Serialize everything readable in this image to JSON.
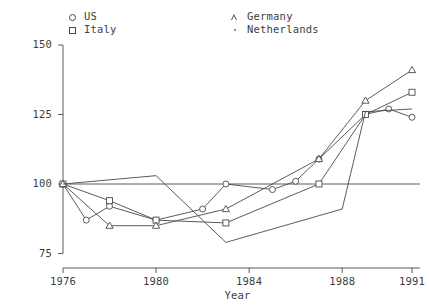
{
  "chart_data": {
    "type": "line",
    "title": "",
    "subtitle": "",
    "xlabel": "Year",
    "ylabel": "",
    "xlim": [
      1976,
      1991
    ],
    "ylim": [
      75,
      150
    ],
    "grid": false,
    "reference_line": 100,
    "legend_position": "top",
    "xticks": [
      1976,
      1980,
      1984,
      1988,
      1991
    ],
    "xtick_labels": [
      "1976",
      "1980",
      "1984",
      "1988",
      "1991"
    ],
    "yticks": [
      75,
      100,
      125,
      150
    ],
    "ytick_labels": [
      "75",
      "100",
      "125",
      "150"
    ],
    "series": [
      {
        "name": "US",
        "marker": "circle",
        "x": [
          1976,
          1977,
          1978,
          1980,
          1982,
          1983,
          1985,
          1986,
          1987,
          1989,
          1990,
          1991
        ],
        "values": [
          100,
          87,
          92,
          87,
          91,
          100,
          98,
          101,
          109,
          125,
          127,
          124
        ]
      },
      {
        "name": "Italy",
        "marker": "square",
        "x": [
          1976,
          1978,
          1980,
          1983,
          1987,
          1989,
          1991
        ],
        "values": [
          100,
          94,
          87,
          86,
          100,
          125,
          133
        ]
      },
      {
        "name": "Germany",
        "marker": "triangle",
        "x": [
          1976,
          1978,
          1980,
          1983,
          1987,
          1989,
          1991
        ],
        "values": [
          100,
          85,
          85,
          91,
          109,
          130,
          141
        ]
      },
      {
        "name": "Netherlands",
        "marker": "dot",
        "x": [
          1976,
          1980,
          1983,
          1988,
          1989,
          1991
        ],
        "values": [
          100,
          103,
          79,
          91,
          126,
          127
        ]
      }
    ]
  },
  "legend": {
    "items": [
      {
        "label": "US",
        "marker": "circle-marker"
      },
      {
        "label": "Italy",
        "marker": "square-marker"
      },
      {
        "label": "Germany",
        "marker": "triangle-marker"
      },
      {
        "label": "Netherlands",
        "marker": "dot-marker"
      }
    ]
  },
  "axes": {
    "x_title": "Year",
    "y_ticks": [
      "150",
      "125",
      "100",
      "75"
    ],
    "x_ticks": [
      "1976",
      "1980",
      "1984",
      "1988",
      "1991"
    ]
  },
  "colors": {
    "line": "#4a4a4a",
    "text": "#3d3d3d",
    "background": "#ffffff"
  }
}
